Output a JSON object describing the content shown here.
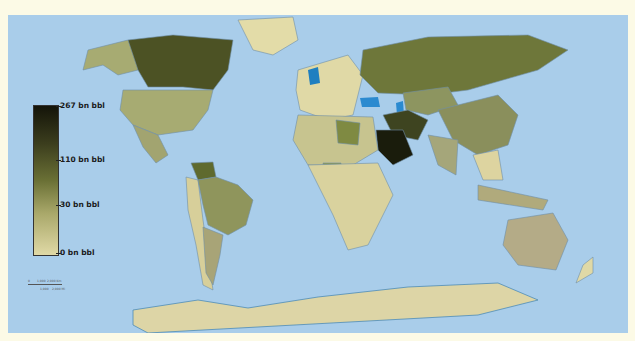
{
  "map": {
    "title": "World proven oil reserves by country",
    "ocean_color": "#a9cdea",
    "background_color": "#fcfae6",
    "color_scale": [
      "#e0d9a6",
      "#a9a86a",
      "#6a7035",
      "#3b3d1d",
      "#141409"
    ]
  },
  "legend": {
    "labels": [
      {
        "value": "267 bn bbl"
      },
      {
        "value": "110 bn bbl"
      },
      {
        "value": "30 bn bbl"
      },
      {
        "value": "0 bn bbl"
      }
    ]
  },
  "scale_bar": {
    "km_start": "0",
    "km_mid": "1,000",
    "km_end": "2,000 Km",
    "mi_mid": "1,000",
    "mi_end": "2,000 Mi"
  },
  "regions": [
    {
      "name": "Saudi Arabia",
      "shade": "darkest"
    },
    {
      "name": "Iran",
      "shade": "dark"
    },
    {
      "name": "Iraq",
      "shade": "dark"
    },
    {
      "name": "Canada",
      "shade": "dark"
    },
    {
      "name": "Russia",
      "shade": "medium-dark"
    },
    {
      "name": "Venezuela",
      "shade": "medium-dark"
    },
    {
      "name": "Libya",
      "shade": "medium"
    },
    {
      "name": "Nigeria",
      "shade": "medium"
    },
    {
      "name": "Kazakhstan",
      "shade": "medium"
    },
    {
      "name": "United States",
      "shade": "medium-light"
    },
    {
      "name": "China",
      "shade": "medium-light"
    },
    {
      "name": "Brazil",
      "shade": "medium-light"
    },
    {
      "name": "Australia",
      "shade": "light-grey"
    },
    {
      "name": "Antarctica",
      "shade": "lightest"
    },
    {
      "name": "Greenland",
      "shade": "lightest"
    },
    {
      "name": "Caspian Sea",
      "shade": "water-highlight"
    },
    {
      "name": "Black Sea",
      "shade": "water-highlight"
    }
  ]
}
